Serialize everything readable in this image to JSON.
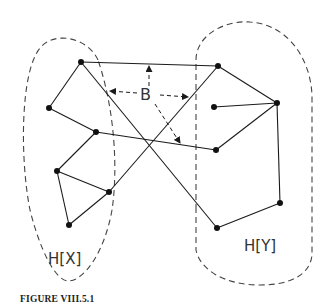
{
  "caption": "FIGURE VIII.5.1",
  "labels": {
    "hx": "H[X]",
    "hy": "H[Y]",
    "b": "B"
  },
  "colors": {
    "ink": "#1a1a1a",
    "dash": "#444444"
  },
  "graph": {
    "nodes": [
      {
        "id": "x1",
        "x": 81,
        "y": 62,
        "side": "X"
      },
      {
        "id": "x2",
        "x": 49,
        "y": 108,
        "side": "X"
      },
      {
        "id": "x3",
        "x": 96,
        "y": 132,
        "side": "X"
      },
      {
        "id": "x4",
        "x": 57,
        "y": 171,
        "side": "X"
      },
      {
        "id": "x5",
        "x": 109,
        "y": 192,
        "side": "X"
      },
      {
        "id": "x6",
        "x": 69,
        "y": 225,
        "side": "X"
      },
      {
        "id": "y1",
        "x": 218,
        "y": 66,
        "side": "Y"
      },
      {
        "id": "y2",
        "x": 277,
        "y": 103,
        "side": "Y"
      },
      {
        "id": "y3",
        "x": 214,
        "y": 107,
        "side": "Y"
      },
      {
        "id": "y4",
        "x": 216,
        "y": 150,
        "side": "Y"
      },
      {
        "id": "y5",
        "x": 280,
        "y": 203,
        "side": "Y"
      },
      {
        "id": "y6",
        "x": 217,
        "y": 228,
        "side": "Y"
      }
    ],
    "edges_within_X": [
      [
        "x1",
        "x2"
      ],
      [
        "x2",
        "x3"
      ],
      [
        "x3",
        "x4"
      ],
      [
        "x4",
        "x5"
      ],
      [
        "x4",
        "x6"
      ],
      [
        "x6",
        "x5"
      ]
    ],
    "edges_within_Y": [
      [
        "y1",
        "y2"
      ],
      [
        "y3",
        "y2"
      ],
      [
        "y2",
        "y4"
      ],
      [
        "y2",
        "y5"
      ],
      [
        "y5",
        "y6"
      ]
    ],
    "edges_between_B": [
      [
        "x1",
        "y1"
      ],
      [
        "x1",
        "y6"
      ],
      [
        "x3",
        "y4"
      ],
      [
        "x5",
        "y1"
      ]
    ]
  }
}
